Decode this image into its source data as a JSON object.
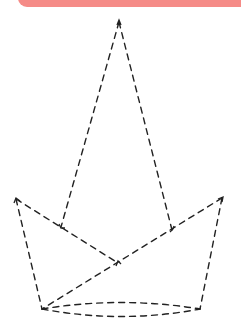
{
  "header": {
    "band_color": "#f58b87"
  },
  "figure": {
    "stroke_color": "#222222",
    "vertices": {
      "apex": [
        119,
        22
      ],
      "left_top": [
        16,
        199
      ],
      "right_top": [
        222,
        198
      ],
      "inner_left": [
        61,
        227
      ],
      "inner_right": [
        172,
        230
      ],
      "center": [
        118,
        263
      ],
      "bottom_left": [
        42,
        309
      ],
      "bottom_right": [
        200,
        309
      ]
    }
  }
}
